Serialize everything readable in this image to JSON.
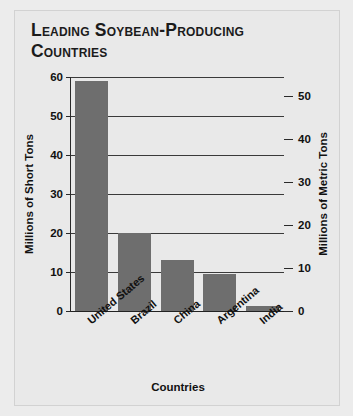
{
  "chart_data": {
    "type": "bar",
    "title": "Leading Soybean-Producing Countries",
    "xlabel": "Countries",
    "ylabel": "Millions of Short Tons",
    "y2label": "Millions of Metric Tons",
    "categories": [
      "United States",
      "Brazil",
      "China",
      "Argentina",
      "India"
    ],
    "values": [
      59,
      20,
      13,
      9.6,
      1.2
    ],
    "ylim": [
      0,
      60
    ],
    "yticks": [
      0,
      10,
      20,
      30,
      40,
      50,
      60
    ],
    "y2lim": [
      0,
      54.4
    ],
    "y2ticks": [
      0,
      10,
      20,
      30,
      40,
      50
    ],
    "grid": true,
    "legend": "none",
    "series": [
      {
        "name": "Soybean production",
        "values": [
          59,
          20,
          13,
          9.6,
          1.2
        ]
      }
    ],
    "bar_color": "#6e6e6e",
    "background_color": "#e9e9e9"
  }
}
